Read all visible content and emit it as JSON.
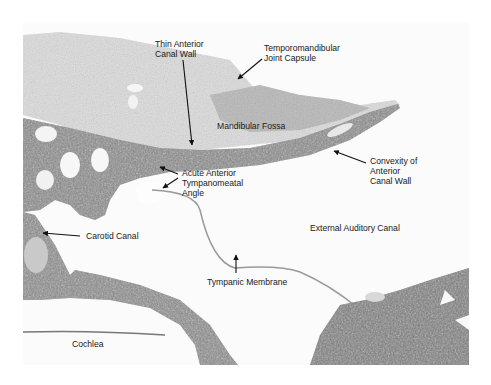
{
  "figure": {
    "labels": {
      "thin_anterior_canal_wall": [
        "Thin Anterior",
        "Canal Wall"
      ],
      "tmj_capsule": [
        "Temporomandibular",
        "Joint Capsule"
      ],
      "mandibular_fossa": "Mandibular Fossa",
      "acute_angle": [
        "Acute Anterior",
        "Tympanomeatal",
        "Angle"
      ],
      "convexity": [
        "Convexity of",
        "Anterior",
        "Canal Wall"
      ],
      "carotid_canal": "Carotid Canal",
      "external_auditory_canal": "External Auditory Canal",
      "tympanic_membrane": "Tympanic Membrane",
      "cochlea": "Cochlea"
    },
    "colors": {
      "background": "#ffffff",
      "soft_tissue": "#d9d9d9",
      "bone": "#7a7a7a",
      "bone_dark": "#4a4a4a",
      "text": "#1a1a1a"
    }
  }
}
